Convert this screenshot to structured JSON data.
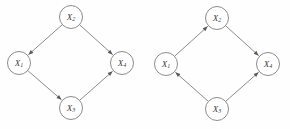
{
  "figure": {
    "title": "",
    "background_color": "#fefefe",
    "stroke_color": "#6e6e6e",
    "label_color": "#3a3a3a",
    "node_radius": 11.5
  },
  "graphs": [
    {
      "id": "left-dag",
      "name": "left-graph",
      "nodes": [
        {
          "id": "L2",
          "label": "X",
          "subscript": "2",
          "cx": 71,
          "cy": 17
        },
        {
          "id": "L1",
          "label": "X",
          "subscript": "1",
          "cx": 19,
          "cy": 63
        },
        {
          "id": "L4",
          "label": "X",
          "subscript": "4",
          "cx": 122,
          "cy": 63
        },
        {
          "id": "L3",
          "label": "X",
          "subscript": "3",
          "cx": 71,
          "cy": 108
        }
      ],
      "edges": [
        {
          "id": "L2-L1",
          "from": "L2",
          "to": "L1",
          "label": "X2 to X1"
        },
        {
          "id": "L2-L4",
          "from": "L2",
          "to": "L4",
          "label": "X2 to X4"
        },
        {
          "id": "L1-L3",
          "from": "L1",
          "to": "L3",
          "label": "X1 to X3"
        },
        {
          "id": "L3-L4",
          "from": "L3",
          "to": "L4",
          "label": "X3 to X4"
        }
      ]
    },
    {
      "id": "right-dag",
      "name": "right-graph",
      "nodes": [
        {
          "id": "R2",
          "label": "X",
          "subscript": "2",
          "cx": 217,
          "cy": 18
        },
        {
          "id": "R1",
          "label": "X",
          "subscript": "1",
          "cx": 166,
          "cy": 64
        },
        {
          "id": "R4",
          "label": "X",
          "subscript": "4",
          "cx": 268,
          "cy": 64
        },
        {
          "id": "R3",
          "label": "X",
          "subscript": "3",
          "cx": 217,
          "cy": 109
        }
      ],
      "edges": [
        {
          "id": "R1-R2",
          "from": "R1",
          "to": "R2",
          "label": "X1 to X2"
        },
        {
          "id": "R2-R4",
          "from": "R2",
          "to": "R4",
          "label": "X2 to X4"
        },
        {
          "id": "R3-R1",
          "from": "R3",
          "to": "R1",
          "label": "X3 to X1"
        },
        {
          "id": "R3-R4",
          "from": "R3",
          "to": "R4",
          "label": "X3 to X4"
        }
      ]
    }
  ]
}
